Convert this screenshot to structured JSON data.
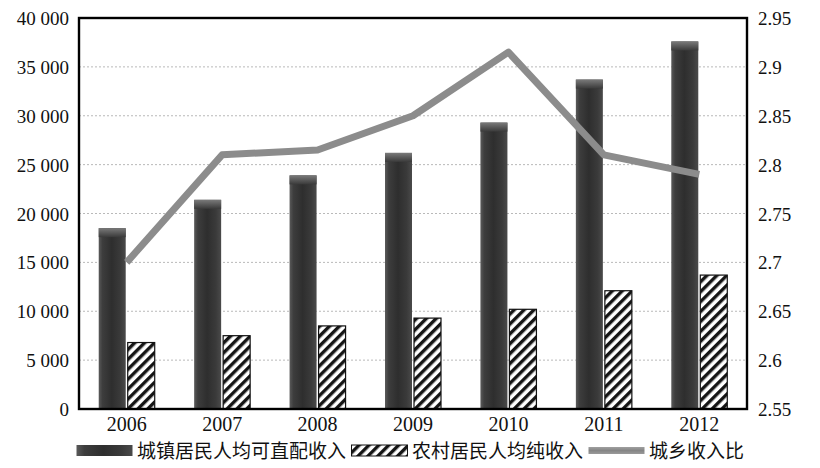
{
  "chart_data": {
    "type": "bar",
    "title": "",
    "subtitle": "",
    "xlabel": "",
    "ylabel": "",
    "categories": [
      "2006",
      "2007",
      "2008",
      "2009",
      "2010",
      "2011",
      "2012"
    ],
    "series": [
      {
        "name": "城镇居民人均可直配收入",
        "type": "bar",
        "axis": "left",
        "color": "#3b3b3b",
        "fill_style": "solid-gradient",
        "values": [
          18500,
          21400,
          23900,
          26200,
          29300,
          33700,
          37600
        ]
      },
      {
        "name": "农村居民人均纯收入",
        "type": "bar",
        "axis": "left",
        "color": "#1a1a1a",
        "fill_style": "diagonal-hatch",
        "values": [
          6800,
          7500,
          8500,
          9300,
          10200,
          12100,
          13700
        ]
      },
      {
        "name": "城乡收入比",
        "type": "line",
        "axis": "right",
        "color": "#8c8c8c",
        "values": [
          2.7,
          2.81,
          2.815,
          2.85,
          2.915,
          2.81,
          2.79
        ]
      }
    ],
    "left_axis": {
      "label": "",
      "ylim": [
        0,
        40000
      ],
      "ticks": [
        0,
        5000,
        10000,
        15000,
        20000,
        25000,
        30000,
        35000,
        40000
      ],
      "tick_labels": [
        "0",
        "5 000",
        "10 000",
        "15 000",
        "20 000",
        "25 000",
        "30 000",
        "35 000",
        "40 000"
      ]
    },
    "right_axis": {
      "label": "",
      "ylim": [
        2.55,
        2.95
      ],
      "ticks": [
        2.55,
        2.6,
        2.65,
        2.7,
        2.75,
        2.8,
        2.85,
        2.9,
        2.95
      ],
      "tick_labels": [
        "2.55",
        "2.6",
        "2.65",
        "2.7",
        "2.75",
        "2.8",
        "2.85",
        "2.9",
        "2.95"
      ]
    },
    "grid": true,
    "legend_position": "bottom"
  },
  "legend": {
    "items": [
      {
        "label": "城镇居民人均可直配收入",
        "swatch": "solid-gradient"
      },
      {
        "label": "农村居民人均纯收入",
        "swatch": "diagonal-hatch"
      },
      {
        "label": "城乡收入比",
        "swatch": "line"
      }
    ]
  },
  "colors": {
    "bar_urban": "#3b3b3b",
    "bar_rural": "#1f1f1f",
    "line_ratio": "#8c8c8c",
    "grid": "#b9b9b9",
    "frame": "#000000"
  }
}
